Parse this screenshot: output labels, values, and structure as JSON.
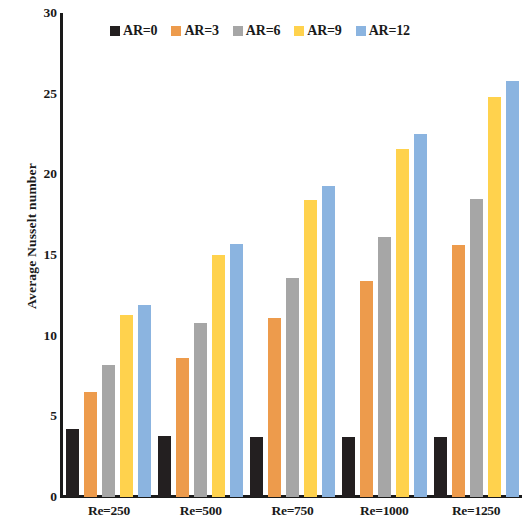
{
  "chart_data": {
    "type": "bar",
    "title": "",
    "xlabel": "",
    "ylabel": "Average Nusselt number",
    "ylim": [
      0,
      30
    ],
    "yticks": [
      0,
      5,
      10,
      15,
      20,
      25,
      30
    ],
    "grid": false,
    "legend_position": "top-center",
    "categories": [
      "Re=250",
      "Re=500",
      "Re=750",
      "Re=1000",
      "Re=1250"
    ],
    "series": [
      {
        "name": "AR=0",
        "color": "#231f20",
        "values": [
          4.2,
          3.8,
          3.7,
          3.7,
          3.7
        ]
      },
      {
        "name": "AR=3",
        "color": "#ed9b4c",
        "values": [
          6.5,
          8.6,
          11.1,
          13.4,
          15.6
        ]
      },
      {
        "name": "AR=6",
        "color": "#a6a6a6",
        "values": [
          8.2,
          10.8,
          13.6,
          16.1,
          18.5
        ]
      },
      {
        "name": "AR=9",
        "color": "#ffd24d",
        "values": [
          11.3,
          15.0,
          18.4,
          21.6,
          24.8
        ]
      },
      {
        "name": "AR=12",
        "color": "#8bb4e0",
        "values": [
          11.9,
          15.7,
          19.3,
          22.5,
          25.8
        ]
      }
    ]
  },
  "axis": {
    "axis_color": "#1a1a1a"
  }
}
